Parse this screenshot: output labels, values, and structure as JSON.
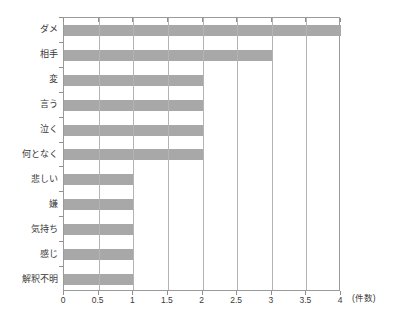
{
  "chart_data": {
    "type": "bar",
    "orientation": "horizontal",
    "title": "",
    "subtitle": "",
    "xlabel": "(件数)",
    "ylabel": "",
    "categories": [
      "ダメ",
      "相手",
      "変",
      "言う",
      "泣く",
      "何となく",
      "悲しい",
      "嫌",
      "気持ち",
      "感じ",
      "解釈不明"
    ],
    "values": [
      4,
      3,
      2,
      2,
      2,
      2,
      1,
      1,
      1,
      1,
      1
    ],
    "xlim": [
      0,
      4
    ],
    "ylim": null,
    "xticks": [
      0,
      0.5,
      1,
      1.5,
      2,
      2.5,
      3,
      3.5,
      4
    ],
    "xtick_labels": [
      "0",
      "0.5",
      "1",
      "1.5",
      "2",
      "2.5",
      "3",
      "3.5",
      "4"
    ],
    "grid": "vertical",
    "legend": null,
    "annotations": [],
    "colors": {
      "bar": "#a8a8a8",
      "gridline": "#b4b4b4",
      "frame": "#9a9a9a",
      "text": "#3a3a3a",
      "background": "#ffffff"
    }
  },
  "axis": {
    "unit_label": "(件数)"
  }
}
